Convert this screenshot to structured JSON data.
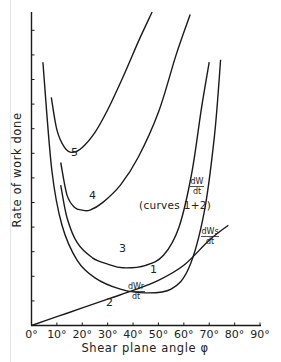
{
  "chart_data": {
    "type": "line",
    "title": "",
    "xlabel": "Shear plane angle φ",
    "ylabel": "Rate of work done",
    "xlim": [
      0,
      90
    ],
    "ylim": [
      0,
      12.5
    ],
    "x_ticks": [
      "0°",
      "10°",
      "20°",
      "30°",
      "40°",
      "50°",
      "60°",
      "70°",
      "80°",
      "90°"
    ],
    "y_ticks_count": 12,
    "y_tick_labels": [],
    "grid": false,
    "legend": "none (curves labelled inline)",
    "series": [
      {
        "name": "1",
        "label": "dW/dt (curves 1+2)",
        "x": [
          4.5,
          8,
          12,
          18,
          25,
          35,
          45,
          55,
          62,
          68,
          72,
          74.5
        ],
        "y": [
          10.5,
          6.2,
          4.0,
          2.6,
          1.9,
          1.45,
          1.3,
          1.45,
          2.3,
          4.5,
          7.5,
          10.6
        ]
      },
      {
        "name": "2",
        "label": "dWr/dt",
        "x": [
          0,
          10,
          20,
          30,
          40,
          50,
          60,
          70,
          77.5
        ],
        "y": [
          0,
          0.35,
          0.7,
          1.05,
          1.4,
          1.8,
          2.4,
          3.4,
          4.0
        ]
      },
      {
        "name": "3",
        "label": "dWs/dt",
        "x": [
          11.5,
          14,
          18,
          24,
          30,
          36,
          45,
          52,
          58,
          63,
          67,
          70
        ],
        "y": [
          5.6,
          4.3,
          3.3,
          2.7,
          2.45,
          2.3,
          2.4,
          2.8,
          3.9,
          6.0,
          8.7,
          10.5
        ]
      },
      {
        "name": "4",
        "label": "",
        "x": [
          11.5,
          14,
          17,
          20,
          23,
          28,
          35,
          42,
          50,
          57,
          62.5
        ],
        "y": [
          6.5,
          5.2,
          4.7,
          4.6,
          4.6,
          4.9,
          5.6,
          6.7,
          8.5,
          10.8,
          12.4
        ]
      },
      {
        "name": "5",
        "label": "",
        "x": [
          7.8,
          10,
          13,
          16,
          20,
          25,
          30,
          36,
          42,
          47.5
        ],
        "y": [
          9.1,
          7.8,
          7.1,
          6.9,
          7.1,
          7.7,
          8.6,
          9.9,
          11.3,
          12.5
        ]
      }
    ],
    "annotations": [
      "dW/dt",
      "(curves 1+2)",
      "dWs/dt",
      "dWr/dt",
      "1",
      "2",
      "3",
      "4",
      "5"
    ]
  },
  "labels": {
    "ylabel": "Rate of work done",
    "xlabel": "Shear plane angle φ",
    "curve_1": "1",
    "curve_2": "2",
    "curve_3": "3",
    "curve_4": "4",
    "curve_5": "5",
    "dw_num": "dW",
    "dw_den": "dt",
    "dw_note": "(curves 1+2)",
    "dws_num": "dWs",
    "dws_den": "dt",
    "dwr_num": "dWr",
    "dwr_den": "dt"
  }
}
